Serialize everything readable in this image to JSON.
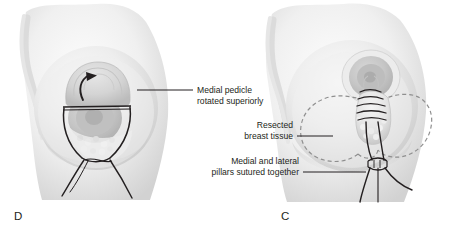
{
  "figure": {
    "type": "medical-illustration",
    "background_color": "#ffffff",
    "ink_color": "#231f20",
    "skin_tone_light": "#f2f2f2",
    "skin_tone_mid": "#dcdcdc",
    "skin_tone_dark": "#bdbdbd",
    "dashed_outline_color": "#8f8f8f"
  },
  "panels": [
    {
      "id": "panel-d",
      "letter": "D",
      "position": "left",
      "description": "Breast with medial pedicle rotated superiorly and pillars marked"
    },
    {
      "id": "panel-c",
      "letter": "C",
      "position": "right",
      "description": "Breast with resected tissue outlined and pillars sutured together"
    }
  ],
  "annotations": [
    {
      "id": "medial-pedicle",
      "lines": [
        "Medial pedicle",
        "rotated superiorly"
      ],
      "align": "left",
      "leader": "horizontal-left"
    },
    {
      "id": "resected-breast-tissue",
      "lines": [
        "Resected",
        "breast tissue"
      ],
      "align": "right",
      "leader": "horizontal-right"
    },
    {
      "id": "pillars-sutured",
      "lines": [
        "Medial and lateral",
        "pillars sutured together"
      ],
      "align": "right",
      "leader": "horizontal-right"
    }
  ]
}
